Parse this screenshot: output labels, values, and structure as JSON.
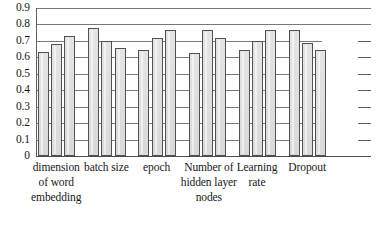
{
  "chart_data": {
    "type": "bar",
    "title": "",
    "subtitle": "",
    "xlabel": "",
    "ylabel": "",
    "ylim": [
      0,
      0.9
    ],
    "grid": true,
    "legend": "none",
    "categories": [
      "dimension of word embedding",
      "batch size",
      "epoch",
      "Number of hidden layer nodes",
      "Learning rate",
      "Dropout"
    ],
    "category_lines": [
      [
        "dimension",
        "of word",
        "embedding"
      ],
      [
        "batch size"
      ],
      [
        "epoch"
      ],
      [
        "Number of",
        "hidden layer",
        "nodes"
      ],
      [
        "Learning",
        "rate"
      ],
      [
        "Dropout"
      ]
    ],
    "y_ticks": [
      "0.9",
      "0.8",
      "0.7",
      "0.6",
      "0.5",
      "0.4",
      "0.3",
      "0.2",
      "0.1",
      "0"
    ],
    "y_tick_values": [
      0.9,
      0.8,
      0.7,
      0.6,
      0.5,
      0.4,
      0.3,
      0.2,
      0.1,
      0
    ],
    "series": [
      {
        "name": "value 1",
        "values": [
          0.63,
          0.78,
          0.645,
          0.625,
          0.645,
          0.765
        ]
      },
      {
        "name": "value 2",
        "values": [
          0.68,
          0.7,
          0.715,
          0.765,
          0.7,
          0.69
        ]
      },
      {
        "name": "value 3",
        "values": [
          0.73,
          0.655,
          0.765,
          0.72,
          0.765,
          0.645
        ]
      }
    ],
    "bar_values_flat": [
      0.63,
      0.68,
      0.73,
      0.78,
      0.7,
      0.655,
      0.645,
      0.715,
      0.765,
      0.625,
      0.765,
      0.72,
      0.645,
      0.7,
      0.765,
      0.765,
      0.69,
      0.645
    ],
    "colors": {
      "bar_fill": "#dedede",
      "bar_border": "#4f5255",
      "gridline": "#75797c",
      "axis": "#4a4d50",
      "text": "#16181a",
      "background": "#ffffff"
    }
  }
}
